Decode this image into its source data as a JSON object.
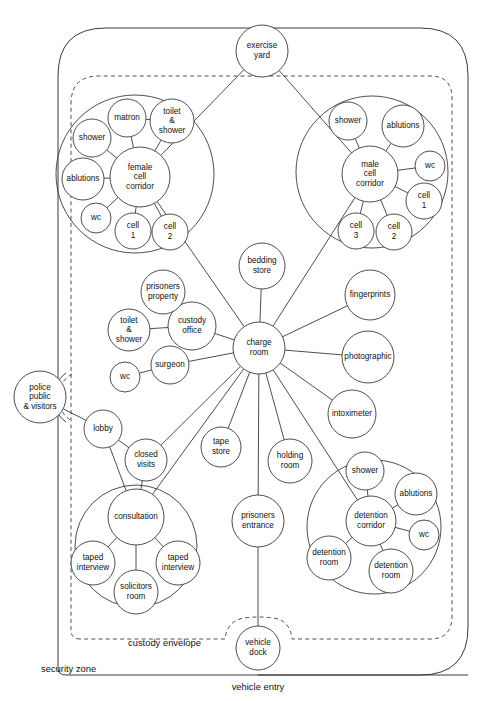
{
  "diagram": {
    "stroke_color": "#3a3a3a",
    "background_color": "#ffffff"
  },
  "zone_labels": [
    {
      "id": "custody-envelope",
      "text": "custody envelope",
      "x": 128,
      "y": 644,
      "anchor": "start"
    },
    {
      "id": "security-zone",
      "text": "security zone",
      "x": 41,
      "y": 670,
      "anchor": "start"
    },
    {
      "id": "vehicle-entry",
      "text": "vehicle entry",
      "x": 258,
      "y": 688,
      "anchor": "middle"
    }
  ],
  "nodes": [
    {
      "id": "exercise-yard",
      "label": "exercise yard",
      "lines": [
        "exercise",
        "yard"
      ],
      "cx": 262,
      "cy": 51,
      "r": 26
    },
    {
      "id": "female-cell-corridor",
      "label": "female cell corridor",
      "lines": [
        "female",
        "cell",
        "corridor"
      ],
      "cx": 140,
      "cy": 177,
      "r": 30
    },
    {
      "id": "female-matron",
      "label": "matron",
      "lines": [
        "matron"
      ],
      "cx": 127,
      "cy": 118,
      "r": 19
    },
    {
      "id": "female-toilet-shower",
      "label": "toilet & shower",
      "lines": [
        "toilet",
        "&",
        "shower"
      ],
      "cx": 172,
      "cy": 121,
      "r": 22
    },
    {
      "id": "female-shower",
      "label": "shower",
      "lines": [
        "shower"
      ],
      "cx": 92,
      "cy": 138,
      "r": 19
    },
    {
      "id": "female-ablutions",
      "label": "ablutions",
      "lines": [
        "ablutions"
      ],
      "cx": 83,
      "cy": 179,
      "r": 21
    },
    {
      "id": "female-wc",
      "label": "wc",
      "lines": [
        "wc"
      ],
      "cx": 96,
      "cy": 218,
      "r": 15
    },
    {
      "id": "female-cell-1",
      "label": "cell 1",
      "lines": [
        "cell",
        "1"
      ],
      "cx": 133,
      "cy": 231,
      "r": 18
    },
    {
      "id": "female-cell-2",
      "label": "cell 2",
      "lines": [
        "cell",
        "2"
      ],
      "cx": 170,
      "cy": 232,
      "r": 18
    },
    {
      "id": "male-cell-corridor",
      "label": "male cell corridor",
      "lines": [
        "male",
        "cell",
        "corridor"
      ],
      "cx": 370,
      "cy": 174,
      "r": 28
    },
    {
      "id": "male-shower",
      "label": "shower",
      "lines": [
        "shower"
      ],
      "cx": 348,
      "cy": 121,
      "r": 19
    },
    {
      "id": "male-ablutions",
      "label": "ablutions",
      "lines": [
        "ablutions"
      ],
      "cx": 403,
      "cy": 126,
      "r": 21
    },
    {
      "id": "male-wc",
      "label": "wc",
      "lines": [
        "wc"
      ],
      "cx": 430,
      "cy": 166,
      "r": 15
    },
    {
      "id": "male-cell-1",
      "label": "cell 1",
      "lines": [
        "cell",
        "1"
      ],
      "cx": 424,
      "cy": 201,
      "r": 18
    },
    {
      "id": "male-cell-2",
      "label": "cell 2",
      "lines": [
        "cell",
        "2"
      ],
      "cx": 394,
      "cy": 232,
      "r": 18
    },
    {
      "id": "male-cell-3",
      "label": "cell 3",
      "lines": [
        "cell",
        "3"
      ],
      "cx": 356,
      "cy": 231,
      "r": 18
    },
    {
      "id": "charge-room",
      "label": "charge room",
      "lines": [
        "charge",
        "room"
      ],
      "cx": 259,
      "cy": 348,
      "r": 26
    },
    {
      "id": "bedding-store",
      "label": "bedding store",
      "lines": [
        "bedding",
        "store"
      ],
      "cx": 262,
      "cy": 266,
      "r": 23
    },
    {
      "id": "custody-office",
      "label": "custody office",
      "lines": [
        "custody",
        "office"
      ],
      "cx": 192,
      "cy": 326,
      "r": 24
    },
    {
      "id": "prisoners-property",
      "label": "prisoners property",
      "lines": [
        "prisoners",
        "property"
      ],
      "cx": 163,
      "cy": 292,
      "r": 22
    },
    {
      "id": "toilet-shower",
      "label": "toilet & shower",
      "lines": [
        "toilet",
        "&",
        "shower"
      ],
      "cx": 129,
      "cy": 330,
      "r": 21
    },
    {
      "id": "surgeon",
      "label": "surgeon",
      "lines": [
        "surgeon"
      ],
      "cx": 170,
      "cy": 365,
      "r": 19
    },
    {
      "id": "wc-surgeon",
      "label": "wc",
      "lines": [
        "wc"
      ],
      "cx": 125,
      "cy": 377,
      "r": 15
    },
    {
      "id": "fingerprints",
      "label": "fingerprints",
      "lines": [
        "fingerprints"
      ],
      "cx": 370,
      "cy": 295,
      "r": 25
    },
    {
      "id": "photographic",
      "label": "photographic",
      "lines": [
        "photographic"
      ],
      "cx": 368,
      "cy": 357,
      "r": 26
    },
    {
      "id": "intoximeter",
      "label": "intoximeter",
      "lines": [
        "intoximeter"
      ],
      "cx": 352,
      "cy": 414,
      "r": 24
    },
    {
      "id": "tape-store",
      "label": "tape store",
      "lines": [
        "tape",
        "store"
      ],
      "cx": 221,
      "cy": 447,
      "r": 20
    },
    {
      "id": "holding-room",
      "label": "holding room",
      "lines": [
        "holding",
        "room"
      ],
      "cx": 290,
      "cy": 461,
      "r": 22
    },
    {
      "id": "prisoners-entrance",
      "label": "prisoners entrance",
      "lines": [
        "prisoners",
        "entrance"
      ],
      "cx": 258,
      "cy": 521,
      "r": 26
    },
    {
      "id": "vehicle-dock",
      "label": "vehicle dock",
      "lines": [
        "vehicle",
        "dock"
      ],
      "cx": 258,
      "cy": 648,
      "r": 22
    },
    {
      "id": "police-public-visitors",
      "label": "police public & visitors",
      "lines": [
        "police",
        "public",
        "& visitors"
      ],
      "cx": 40,
      "cy": 397,
      "r": 26
    },
    {
      "id": "lobby",
      "label": "lobby",
      "lines": [
        "lobby"
      ],
      "cx": 103,
      "cy": 429,
      "r": 19
    },
    {
      "id": "closed-visits",
      "label": "closed visits",
      "lines": [
        "closed",
        "visits"
      ],
      "cx": 146,
      "cy": 460,
      "r": 21
    },
    {
      "id": "consultation",
      "label": "consultation",
      "lines": [
        "consultation"
      ],
      "cx": 136,
      "cy": 517,
      "r": 28
    },
    {
      "id": "taped-interview-1",
      "label": "taped interview",
      "lines": [
        "taped",
        "interview"
      ],
      "cx": 93,
      "cy": 563,
      "r": 22
    },
    {
      "id": "taped-interview-2",
      "label": "taped interview",
      "lines": [
        "taped",
        "interview"
      ],
      "cx": 178,
      "cy": 563,
      "r": 22
    },
    {
      "id": "solicitors-room",
      "label": "solicitors room",
      "lines": [
        "solicitors",
        "room"
      ],
      "cx": 136,
      "cy": 592,
      "r": 22
    },
    {
      "id": "detention-corridor",
      "label": "detention corridor",
      "lines": [
        "detention",
        "corridor"
      ],
      "cx": 371,
      "cy": 521,
      "r": 25
    },
    {
      "id": "detention-shower",
      "label": "shower",
      "lines": [
        "shower"
      ],
      "cx": 365,
      "cy": 471,
      "r": 19
    },
    {
      "id": "detention-ablutions",
      "label": "ablutions",
      "lines": [
        "ablutions"
      ],
      "cx": 416,
      "cy": 494,
      "r": 21
    },
    {
      "id": "detention-wc",
      "label": "wc",
      "lines": [
        "wc"
      ],
      "cx": 424,
      "cy": 535,
      "r": 15
    },
    {
      "id": "detention-room-1",
      "label": "detention room",
      "lines": [
        "detention",
        "room"
      ],
      "cx": 329,
      "cy": 558,
      "r": 22
    },
    {
      "id": "detention-room-2",
      "label": "detention room",
      "lines": [
        "detention",
        "room"
      ],
      "cx": 391,
      "cy": 571,
      "r": 22
    }
  ],
  "group_circles": [
    {
      "id": "female-cluster-ring",
      "cx": 135,
      "cy": 174,
      "r": 79
    },
    {
      "id": "male-cluster-ring",
      "cx": 372,
      "cy": 172,
      "r": 76
    },
    {
      "id": "consultation-cluster-ring",
      "cx": 136,
      "cy": 546,
      "r": 61
    },
    {
      "id": "detention-cluster-ring",
      "cx": 374,
      "cy": 527,
      "r": 67
    }
  ],
  "links": [
    {
      "from": "exercise-yard",
      "to": "female-cell-corridor"
    },
    {
      "from": "exercise-yard",
      "to": "male-cell-corridor"
    },
    {
      "from": "female-cell-corridor",
      "to": "female-matron"
    },
    {
      "from": "female-cell-corridor",
      "to": "female-toilet-shower"
    },
    {
      "from": "female-cell-corridor",
      "to": "female-shower"
    },
    {
      "from": "female-cell-corridor",
      "to": "female-ablutions"
    },
    {
      "from": "female-cell-corridor",
      "to": "female-wc"
    },
    {
      "from": "female-cell-corridor",
      "to": "female-cell-1"
    },
    {
      "from": "female-cell-corridor",
      "to": "female-cell-2"
    },
    {
      "from": "female-matron",
      "to": "female-toilet-shower"
    },
    {
      "from": "female-cell-corridor",
      "to": "charge-room"
    },
    {
      "from": "male-cell-corridor",
      "to": "male-shower"
    },
    {
      "from": "male-cell-corridor",
      "to": "male-ablutions"
    },
    {
      "from": "male-cell-corridor",
      "to": "male-wc"
    },
    {
      "from": "male-cell-corridor",
      "to": "male-cell-1"
    },
    {
      "from": "male-cell-corridor",
      "to": "male-cell-2"
    },
    {
      "from": "male-cell-corridor",
      "to": "male-cell-3"
    },
    {
      "from": "male-cell-corridor",
      "to": "charge-room"
    },
    {
      "from": "charge-room",
      "to": "bedding-store"
    },
    {
      "from": "charge-room",
      "to": "custody-office"
    },
    {
      "from": "charge-room",
      "to": "fingerprints"
    },
    {
      "from": "charge-room",
      "to": "photographic"
    },
    {
      "from": "charge-room",
      "to": "intoximeter"
    },
    {
      "from": "charge-room",
      "to": "surgeon"
    },
    {
      "from": "charge-room",
      "to": "tape-store"
    },
    {
      "from": "charge-room",
      "to": "holding-room"
    },
    {
      "from": "charge-room",
      "to": "prisoners-entrance"
    },
    {
      "from": "charge-room",
      "to": "closed-visits"
    },
    {
      "from": "charge-room",
      "to": "consultation"
    },
    {
      "from": "charge-room",
      "to": "detention-corridor"
    },
    {
      "from": "custody-office",
      "to": "prisoners-property"
    },
    {
      "from": "custody-office",
      "to": "toilet-shower"
    },
    {
      "from": "surgeon",
      "to": "wc-surgeon"
    },
    {
      "from": "police-public-visitors",
      "to": "lobby"
    },
    {
      "from": "lobby",
      "to": "closed-visits"
    },
    {
      "from": "lobby",
      "to": "consultation"
    },
    {
      "from": "closed-visits",
      "to": "consultation"
    },
    {
      "from": "consultation",
      "to": "taped-interview-1"
    },
    {
      "from": "consultation",
      "to": "taped-interview-2"
    },
    {
      "from": "consultation",
      "to": "solicitors-room"
    },
    {
      "from": "detention-corridor",
      "to": "detention-shower"
    },
    {
      "from": "detention-corridor",
      "to": "detention-ablutions"
    },
    {
      "from": "detention-corridor",
      "to": "detention-wc"
    },
    {
      "from": "detention-corridor",
      "to": "detention-room-1"
    },
    {
      "from": "detention-corridor",
      "to": "detention-room-2"
    },
    {
      "from": "prisoners-entrance",
      "to": "vehicle-dock"
    }
  ],
  "boundaries": {
    "security_zone_path": "M 80 675 L 66 675 Q 58 675 58 668 L 58 76 Q 58 28 106 28 L 420 28 Q 468 28 468 76 L 468 627 Q 468 675 420 675 L 80 675 Z",
    "custody_envelope_path": "M 80 639 Q 71 639 71 630 L 71 104 Q 71 76 99 76 L 430 76 Q 452 76 452 98 L 452 616 Q 452 639 430 639 L 292 639 Q 290 620 273 618 Q 258 616 244 618 Q 227 621 225 639 L 80 639 Z",
    "security_zone_bulge": "M 58 378 Q 66 372 70 372 M 58 420 Q 66 423 70 424",
    "police_bulge_solid": "M 66 373 A 30 30 0 0 0 66 422",
    "police_bulge_dashed": "M 72 374 A 27 27 0 0 0 72 421"
  }
}
